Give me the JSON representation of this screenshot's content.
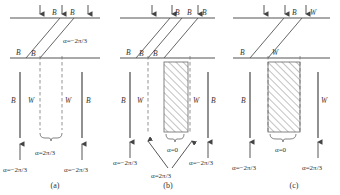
{
  "figure": {
    "panels": [
      {
        "id": "a",
        "caption": "(a)",
        "top_labels": [
          "B",
          "B"
        ],
        "mid_labels": [
          "B",
          "B"
        ],
        "right_angle": "α=−2π/3",
        "column_labels": [
          "B",
          "W",
          "W",
          "B"
        ],
        "brace_label": "α=2π/3",
        "bottom_left_angle": "α=−2π/3",
        "bottom_right_angle": "α=−2π/3",
        "has_hatch": false
      },
      {
        "id": "b",
        "caption": "(b)",
        "top_labels": [
          "B",
          "B",
          "B"
        ],
        "mid_labels": [
          "B",
          "B",
          "B"
        ],
        "column_labels": [
          "B",
          "W",
          "W",
          "B"
        ],
        "hatch_label": "α=0",
        "converge_label": "α=2π/3",
        "bottom_left_angle": "α=−2π/3",
        "bottom_right_angle": "α=−2π/3",
        "has_hatch": true
      },
      {
        "id": "c",
        "caption": "(c)",
        "top_labels": [
          "B",
          "W"
        ],
        "mid_labels": [
          "B",
          "W"
        ],
        "column_labels": [
          "B",
          "W"
        ],
        "hatch_label": "α=0",
        "bottom_left_angle": "α=−2π/3",
        "bottom_right_angle": "α=2π/3",
        "has_hatch": true
      }
    ]
  }
}
